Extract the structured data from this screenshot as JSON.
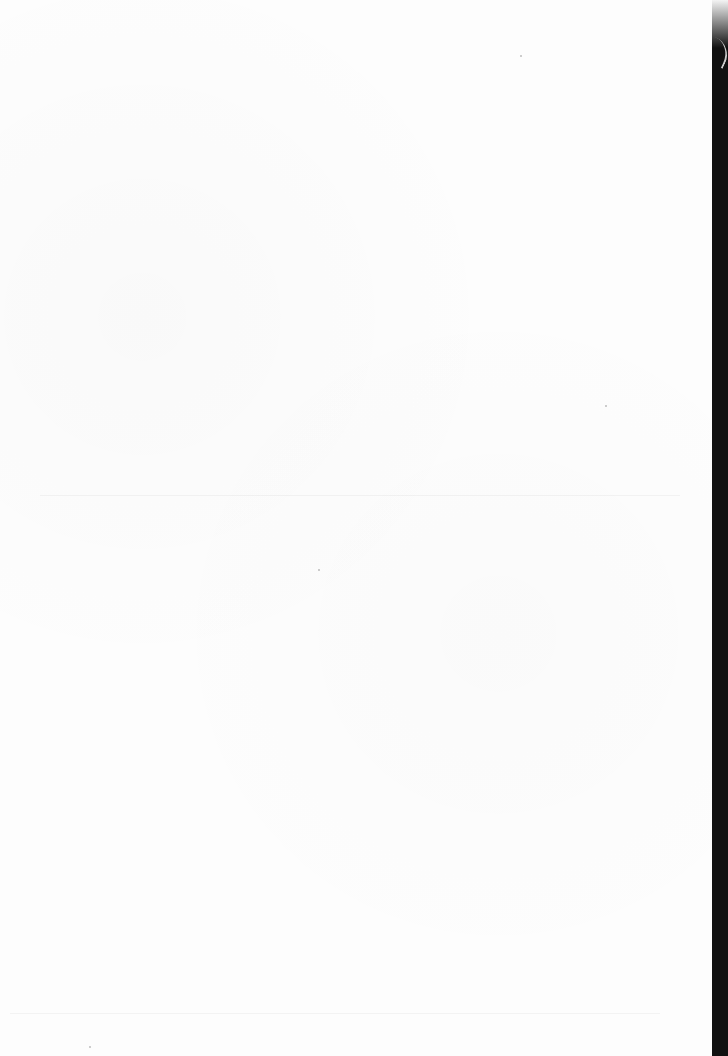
{
  "document": {
    "type": "scanned-page",
    "content": "",
    "colors": {
      "paper": "#fdfdfd",
      "edge": "#111111"
    }
  }
}
